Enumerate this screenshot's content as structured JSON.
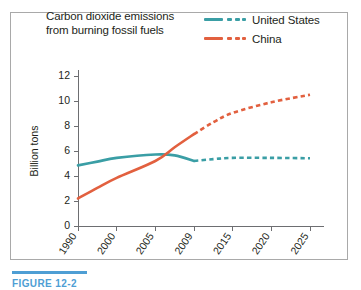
{
  "figure": {
    "caption_label": "FIGURE 12-2",
    "caption_rule_color": "#4e9ed4",
    "frame_border_color": "#a9a9a9"
  },
  "title": {
    "line1": "Carbon dioxide emissions",
    "line2": "from burning fossil fuels"
  },
  "legend": {
    "position": "top-right",
    "items": [
      {
        "label": "United States",
        "color": "#3a9ea5",
        "style": "solid-then-dashed"
      },
      {
        "label": "China",
        "color": "#e2603f",
        "style": "solid-then-dashed"
      }
    ]
  },
  "chart_data": {
    "type": "line",
    "title": "Carbon dioxide emissions from burning fossil fuels",
    "xlabel": "",
    "ylabel": "Billion tons",
    "xlim": [
      1990,
      2025
    ],
    "ylim": [
      0,
      12
    ],
    "yticks": [
      0,
      2,
      4,
      6,
      8,
      10,
      12
    ],
    "xticks": [
      1990,
      2000,
      2005,
      2009,
      2015,
      2020,
      2025
    ],
    "xtick_labels": [
      "1990",
      "2000",
      "2005",
      "2009",
      "2015",
      "2020",
      "2025"
    ],
    "ytick_labels": [
      "0",
      "2",
      "4",
      "6",
      "8",
      "10",
      "12"
    ],
    "grid": false,
    "projection_starts": 2009,
    "series": [
      {
        "name": "United States",
        "color": "#3a9ea5",
        "x": [
          1990,
          1995,
          2000,
          2005,
          2007,
          2009,
          2012,
          2015,
          2020,
          2025
        ],
        "values": [
          4.85,
          5.15,
          5.45,
          5.72,
          5.65,
          5.2,
          5.35,
          5.45,
          5.45,
          5.42
        ],
        "observed_through": 2009
      },
      {
        "name": "China",
        "color": "#e2603f",
        "x": [
          1990,
          1995,
          2000,
          2005,
          2007,
          2009,
          2012,
          2015,
          2020,
          2025
        ],
        "values": [
          2.2,
          3.05,
          3.85,
          5.2,
          6.3,
          7.35,
          8.3,
          9.05,
          9.9,
          10.5
        ],
        "observed_through": 2009
      }
    ]
  }
}
